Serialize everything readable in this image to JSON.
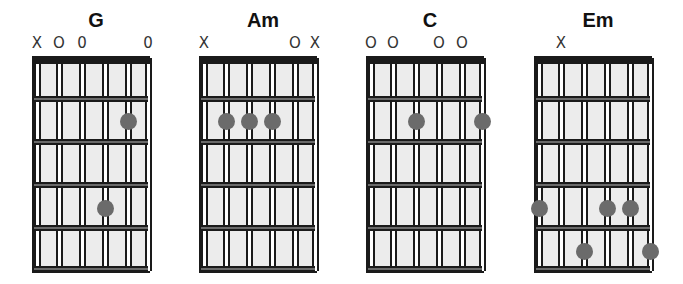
{
  "colors": {
    "background": "#ffffff",
    "fretboard": "#ececec",
    "line": "#1a1a1a",
    "dot": "#6b6b6b"
  },
  "fretboard": {
    "strings": 6,
    "frets": 5
  },
  "chords": [
    {
      "name": "G",
      "markers": [
        "X",
        "O",
        "0",
        "",
        "",
        "0"
      ],
      "dots": [
        {
          "string": 5,
          "fret": 2
        },
        {
          "string": 4,
          "fret": 4
        }
      ]
    },
    {
      "name": "Am",
      "markers": [
        "X",
        "",
        "",
        "",
        "O",
        "X"
      ],
      "dots": [
        {
          "string": 2,
          "fret": 2
        },
        {
          "string": 3,
          "fret": 2
        },
        {
          "string": 4,
          "fret": 2
        }
      ]
    },
    {
      "name": "C",
      "markers": [
        "O",
        "O",
        "",
        "O",
        "O",
        ""
      ],
      "dots": [
        {
          "string": 3,
          "fret": 2
        },
        {
          "string": 6,
          "fret": 2
        }
      ]
    },
    {
      "name": "Em",
      "markers": [
        "",
        "X",
        "",
        "",
        "",
        ""
      ],
      "dots": [
        {
          "string": 1,
          "fret": 4
        },
        {
          "string": 4,
          "fret": 4
        },
        {
          "string": 5,
          "fret": 4
        },
        {
          "string": 3,
          "fret": 5
        },
        {
          "string": 6,
          "fret": 5
        }
      ]
    }
  ]
}
